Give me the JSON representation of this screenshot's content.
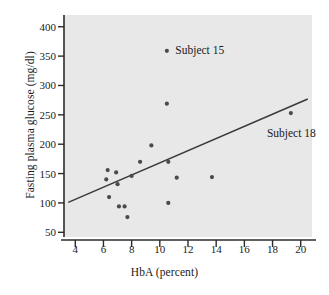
{
  "chart_data": {
    "type": "scatter",
    "title": "",
    "xlabel": "HbA (percent)",
    "ylabel": "Fasting plasma glucose (mg/dl)",
    "xlim": [
      3.2,
      20.8
    ],
    "ylim": [
      42,
      420
    ],
    "xticks": [
      4,
      6,
      8,
      10,
      12,
      14,
      16,
      18,
      20
    ],
    "xticklabels": [
      "4",
      "6",
      "8",
      "10",
      "12",
      "14",
      "16",
      "18",
      "20"
    ],
    "yticks": [
      50,
      100,
      150,
      200,
      250,
      300,
      350,
      400
    ],
    "yticklabels": [
      "50",
      "100",
      "150",
      "200",
      "250",
      "300",
      "350",
      "400"
    ],
    "grid": false,
    "legend": null,
    "plot_background": "#e8e8e8",
    "marker_color": "#4a4a4a",
    "line_color": "#3a3a3a",
    "points": [
      {
        "x": 6.2,
        "y": 140,
        "label": ""
      },
      {
        "x": 6.3,
        "y": 156,
        "label": ""
      },
      {
        "x": 6.4,
        "y": 110,
        "label": ""
      },
      {
        "x": 6.9,
        "y": 152,
        "label": ""
      },
      {
        "x": 7.0,
        "y": 132,
        "label": ""
      },
      {
        "x": 7.1,
        "y": 94,
        "label": ""
      },
      {
        "x": 7.5,
        "y": 94,
        "label": ""
      },
      {
        "x": 7.7,
        "y": 76,
        "label": ""
      },
      {
        "x": 8.0,
        "y": 146,
        "label": ""
      },
      {
        "x": 8.6,
        "y": 170,
        "label": ""
      },
      {
        "x": 9.4,
        "y": 198,
        "label": ""
      },
      {
        "x": 10.5,
        "y": 269,
        "label": ""
      },
      {
        "x": 10.6,
        "y": 100,
        "label": ""
      },
      {
        "x": 10.6,
        "y": 170,
        "label": ""
      },
      {
        "x": 11.2,
        "y": 143,
        "label": ""
      },
      {
        "x": 13.7,
        "y": 144,
        "label": ""
      },
      {
        "x": 10.5,
        "y": 359,
        "label": "Subject 15"
      },
      {
        "x": 19.3,
        "y": 253,
        "label": "Subject 18"
      }
    ],
    "trendline": {
      "x": [
        3.5,
        20.5
      ],
      "y": [
        101,
        277
      ]
    },
    "annotations": [
      {
        "text": "Subject 15",
        "x": 11.1,
        "y": 359
      },
      {
        "text": "Subject 18",
        "x": 17.6,
        "y": 218
      }
    ]
  }
}
